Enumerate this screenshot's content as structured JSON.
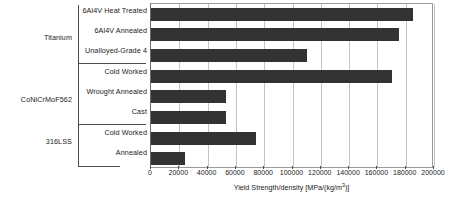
{
  "chart_data": {
    "type": "bar",
    "orientation": "horizontal",
    "title": "",
    "xlabel": "Yield Strength/density [MPa/(kg/m3)]",
    "xlabel_prefix": "Yield Strength/density [MPa/(kg/m",
    "xlabel_sup": "3",
    "xlabel_suffix": ")]",
    "ylabel": "",
    "categories": [
      "6Al4V Heat Treated",
      "6Al4V Annealed",
      "Unalloyed-Grade 4",
      "Cold Worked",
      "Wrought Annealed",
      "Cast",
      "Cold Worked",
      "Annealed"
    ],
    "values": [
      185000,
      175000,
      110000,
      170000,
      53000,
      53000,
      74000,
      24000
    ],
    "groups": [
      {
        "label": "Titanium",
        "start": 0,
        "end": 2
      },
      {
        "label": "CoNiCrMoF562",
        "start": 3,
        "end": 5
      },
      {
        "label": "316LSS",
        "start": 6,
        "end": 7
      }
    ],
    "xlim": [
      0,
      200000
    ],
    "xticks": [
      0,
      20000,
      40000,
      60000,
      80000,
      100000,
      120000,
      140000,
      160000,
      180000,
      200000
    ],
    "xtick_labels": [
      "0",
      "20000",
      "40000",
      "60000",
      "80000",
      "100000",
      "120000",
      "140000",
      "160000",
      "180000",
      "200000"
    ],
    "grid": true,
    "legend": "none",
    "bar_color": "#333333",
    "grid_color": "#c4c4c4",
    "axis_color": "#6b6b6b",
    "background": "#ffffff"
  }
}
